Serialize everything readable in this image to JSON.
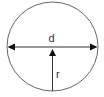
{
  "diagram": {
    "labels": {
      "diameter": "d",
      "radius": "r"
    },
    "colors": {
      "stroke": "#555555",
      "arrow": "#111111",
      "text": "#333333"
    }
  }
}
